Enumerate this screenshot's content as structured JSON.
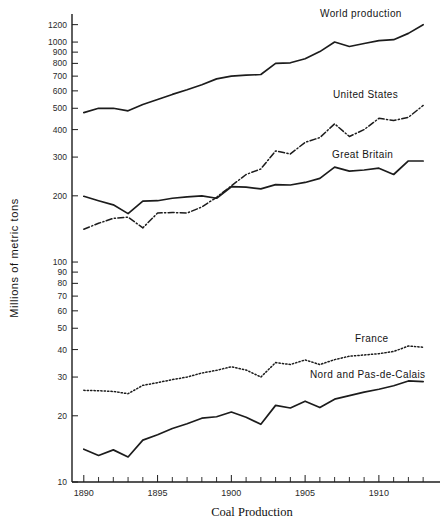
{
  "chart_data": {
    "type": "line",
    "title": "",
    "xlabel": "Coal Production",
    "ylabel": "Millions of metric tons",
    "yscale": "log",
    "ylim": [
      10,
      1300
    ],
    "xlim": [
      1889.2,
      1913.6
    ],
    "grid": false,
    "legend_position": "inline-right-annotations",
    "ytick_labels": [
      "1200",
      "1000",
      "900",
      "800",
      "700",
      "600",
      "500",
      "400",
      "300",
      "200",
      "100",
      "90",
      "80",
      "70",
      "60",
      "50",
      "40",
      "30",
      "20",
      "10"
    ],
    "ytick_values": [
      1200,
      1000,
      900,
      800,
      700,
      600,
      500,
      400,
      300,
      200,
      100,
      90,
      80,
      70,
      60,
      50,
      40,
      30,
      20,
      10
    ],
    "xtick_labels": [
      "1890",
      "1895",
      "1900",
      "1905",
      "1910"
    ],
    "xtick_values": [
      1890,
      1895,
      1900,
      1905,
      1910
    ],
    "x": [
      1890,
      1891,
      1892,
      1893,
      1894,
      1895,
      1896,
      1897,
      1898,
      1899,
      1900,
      1901,
      1902,
      1903,
      1904,
      1905,
      1906,
      1907,
      1908,
      1909,
      1910,
      1911,
      1912,
      1913
    ],
    "series": [
      {
        "name": "World production",
        "style": "solid",
        "values": [
          478,
          500,
          500,
          487,
          520,
          548,
          578,
          607,
          640,
          680,
          700,
          707,
          712,
          800,
          805,
          840,
          905,
          1000,
          955,
          985,
          1015,
          1025,
          1095,
          1200
        ]
      },
      {
        "name": "United States",
        "style": "dash-dot",
        "values": [
          141,
          150,
          158,
          160,
          143,
          167,
          168,
          167,
          178,
          197,
          222,
          250,
          265,
          320,
          310,
          350,
          368,
          425,
          372,
          400,
          450,
          440,
          455,
          515
        ]
      },
      {
        "name": "Great Britain",
        "style": "solid",
        "values": [
          199,
          190,
          182,
          166,
          189,
          190,
          195,
          198,
          200,
          195,
          220,
          219,
          215,
          225,
          224,
          230,
          240,
          270,
          259,
          262,
          267,
          250,
          288,
          288
        ]
      },
      {
        "name": "France",
        "style": "dotted",
        "values": [
          26.1,
          26.0,
          25.8,
          25.2,
          27.5,
          28.3,
          29.2,
          30.0,
          31.3,
          32.2,
          33.4,
          32.3,
          30.0,
          34.9,
          34.2,
          35.9,
          34.2,
          36.0,
          37.3,
          37.8,
          38.3,
          39.2,
          41.5,
          41.0
        ]
      },
      {
        "name": "Nord and Pas-de-Calais",
        "style": "solid",
        "values": [
          14.1,
          13.2,
          14.0,
          13.0,
          15.5,
          16.4,
          17.5,
          18.4,
          19.5,
          19.8,
          20.8,
          19.7,
          18.3,
          22.3,
          21.7,
          23.3,
          21.8,
          23.8,
          24.7,
          25.6,
          26.4,
          27.4,
          28.8,
          28.6
        ]
      }
    ],
    "annotations": [
      {
        "text": "World production",
        "anchor_x": 320,
        "anchor_y": 17
      },
      {
        "text": "United States",
        "anchor_x": 333,
        "anchor_y": 98
      },
      {
        "text": "Great Britain",
        "anchor_x": 332,
        "anchor_y": 158
      },
      {
        "text": "France",
        "anchor_x": 355,
        "anchor_y": 342
      },
      {
        "text": "Nord and Pas-de-Calais",
        "anchor_x": 310,
        "anchor_y": 378
      }
    ]
  },
  "axis": {
    "x_title": "Coal Production",
    "y_title": "Millions of metric tons"
  },
  "colors": {
    "ink": "#1c1c1c",
    "background": "#ffffff"
  }
}
